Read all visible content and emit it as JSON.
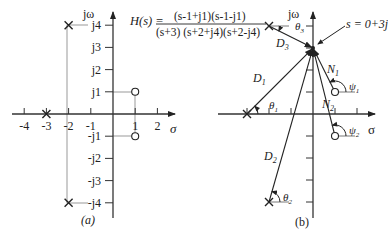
{
  "figure_a": {
    "caption": "(a)",
    "y_axis_label": "jω",
    "x_axis_label": "σ",
    "x_ticks": [
      "-4",
      "-3",
      "-2",
      "-1",
      "1",
      "2"
    ],
    "x_tick_values": [
      -4,
      -3,
      -2,
      -1,
      1,
      2
    ],
    "y_ticks": [
      "j4",
      "j3",
      "j2",
      "j1",
      "-j1",
      "-j2",
      "-j3",
      "-j4"
    ],
    "y_tick_values": [
      4,
      3,
      2,
      1,
      -1,
      -2,
      -3,
      -4
    ],
    "poles": [
      {
        "re": -2,
        "im": 4
      },
      {
        "re": -2,
        "im": -4
      },
      {
        "re": -3,
        "im": 0
      }
    ],
    "zeros": [
      {
        "re": 1,
        "im": 1
      },
      {
        "re": 1,
        "im": -1
      }
    ]
  },
  "transfer_function": {
    "lhs": "H(s) =",
    "numerator": "(s-1+j1)(s-1-j1)",
    "denominator": "(s+3) (s+2+j4)(s+2-j4)"
  },
  "figure_b": {
    "caption": "(b)",
    "y_axis_label": "jω",
    "x_axis_label": "σ",
    "test_point_label": "s = 0+3j",
    "test_point": {
      "re": 0,
      "im": 3
    },
    "vectors": [
      {
        "from": "pole (-3,0)",
        "label": "D1",
        "angle_label": "θ1"
      },
      {
        "from": "pole (-2,-4)",
        "label": "D2",
        "angle_label": "θ2"
      },
      {
        "from": "pole (-2,4)",
        "label": "D3",
        "angle_label": "θ3"
      },
      {
        "from": "zero (1,1)",
        "label": "N1",
        "angle_label": "ψ1"
      },
      {
        "from": "zero (1,-1)",
        "label": "N2",
        "angle_label": "ψ2"
      }
    ]
  }
}
